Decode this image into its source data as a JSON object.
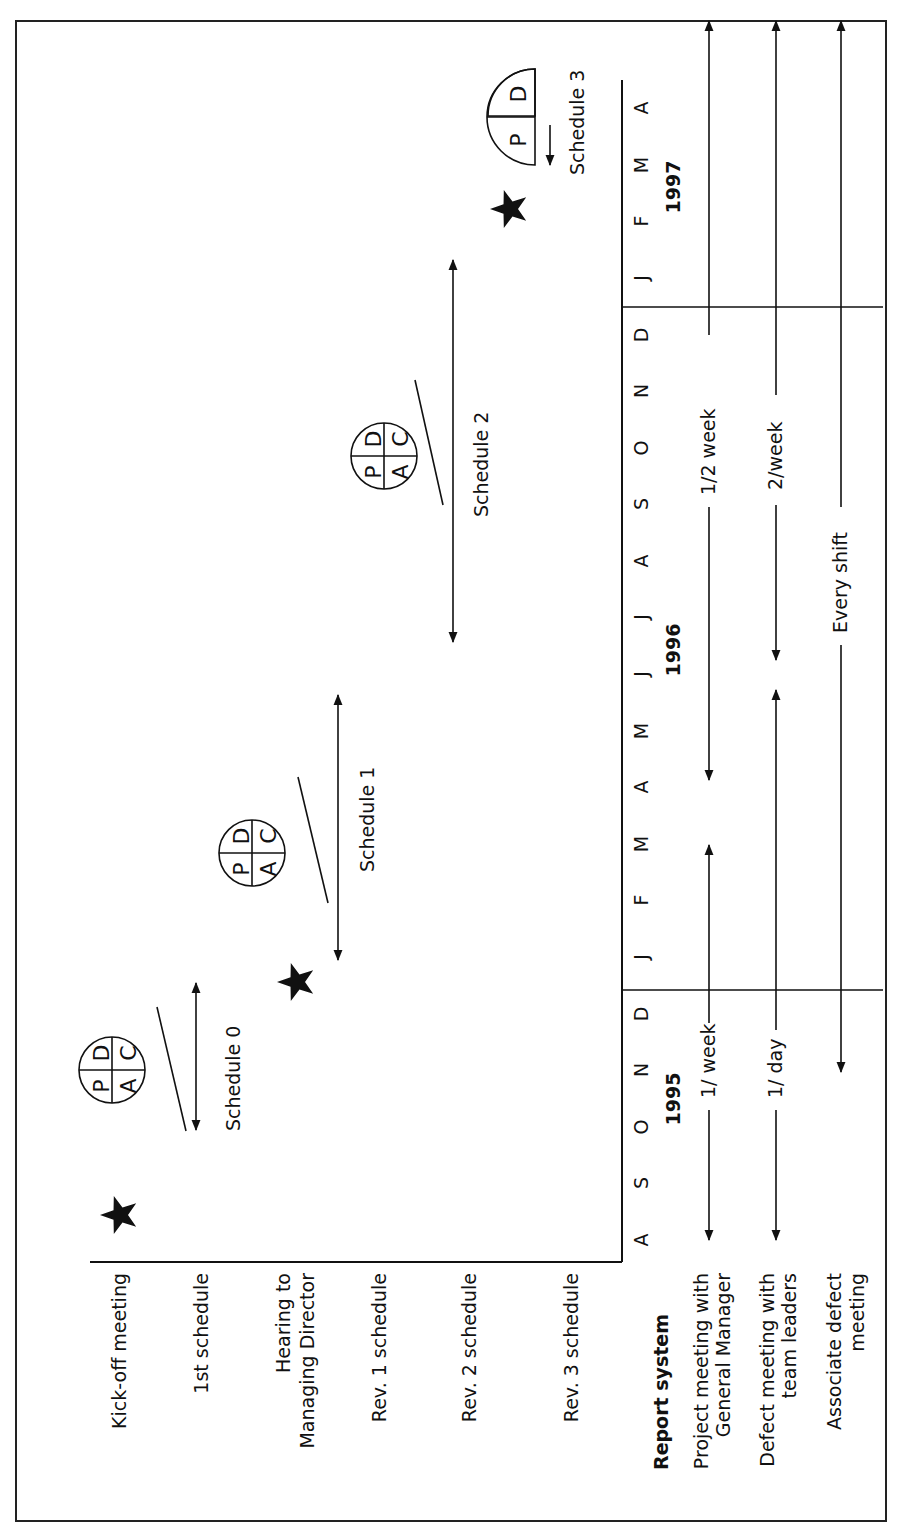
{
  "diagram": {
    "orientation": "rotated-90-ccw",
    "rows": [
      {
        "id": "kickoff",
        "lines": [
          "Kick-off meeting"
        ]
      },
      {
        "id": "first-schedule",
        "lines": [
          "1st schedule"
        ]
      },
      {
        "id": "hearing",
        "lines": [
          "Hearing to",
          "Managing Director"
        ]
      },
      {
        "id": "rev1",
        "lines": [
          "Rev. 1 schedule"
        ]
      },
      {
        "id": "rev2",
        "lines": [
          "Rev. 2 schedule"
        ]
      },
      {
        "id": "rev3",
        "lines": [
          "Rev. 3 schedule"
        ]
      }
    ],
    "report_system": {
      "title": "Report system",
      "rows": [
        {
          "id": "pm-gm",
          "lines": [
            "Project meeting with",
            "General Manager"
          ]
        },
        {
          "id": "dm-tl",
          "lines": [
            "Defect meeting with",
            "team leaders"
          ]
        },
        {
          "id": "assoc",
          "lines": [
            "Associate defect",
            "meeting"
          ]
        }
      ]
    },
    "months": [
      "A",
      "S",
      "O",
      "N",
      "D",
      "J",
      "F",
      "M",
      "A",
      "M",
      "J",
      "J",
      "A",
      "S",
      "O",
      "N",
      "D",
      "J",
      "F",
      "M",
      "A"
    ],
    "years": [
      "1995",
      "1996",
      "1997"
    ],
    "schedules": [
      {
        "label": "Schedule 0",
        "pdca": [
          "P",
          "D",
          "A",
          "C"
        ]
      },
      {
        "label": "Schedule 1",
        "pdca": [
          "P",
          "D",
          "A",
          "C"
        ]
      },
      {
        "label": "Schedule 2",
        "pdca": [
          "P",
          "D",
          "A",
          "C"
        ]
      },
      {
        "label": "Schedule 3",
        "pdca": [
          "P",
          "D"
        ]
      }
    ],
    "frequencies": {
      "pm_first": "1/ week",
      "pm_second": "1/2 week",
      "dm_first": "1/ day",
      "dm_second": "2/week",
      "assoc": "Every shift"
    },
    "colors": {
      "ink": "#111111",
      "background": "#ffffff"
    }
  }
}
